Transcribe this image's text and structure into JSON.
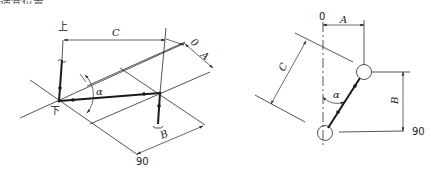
{
  "header": {
    "cropped_text": "适宜位置…"
  },
  "left_diagram": {
    "labels": {
      "top": "上",
      "bottom": "下",
      "dim_c": "C",
      "dim_a": "A",
      "dim_b": "B",
      "zero": "0",
      "angle": "α",
      "right_angle": "90"
    }
  },
  "right_diagram": {
    "labels": {
      "zero": "0",
      "dim_a": "A",
      "dim_b": "B",
      "dim_c": "C",
      "angle": "α",
      "right_angle": "90"
    }
  },
  "colors": {
    "line": "#2a2a2a",
    "background": "#ffffff"
  }
}
